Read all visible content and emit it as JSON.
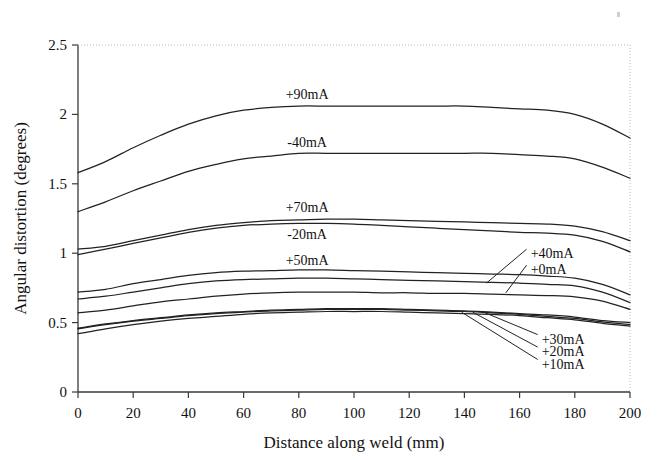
{
  "chart_data": {
    "type": "line",
    "title": "",
    "xlabel": "Distance along weld (mm)",
    "ylabel": "Angular distortion (degrees)",
    "xlim": [
      0,
      200
    ],
    "ylim": [
      0,
      2.5
    ],
    "xticks": [
      0,
      20,
      40,
      60,
      80,
      100,
      120,
      140,
      160,
      180,
      200
    ],
    "yticks": [
      0,
      0.5,
      1,
      1.5,
      2,
      2.5
    ],
    "xtick_labels": [
      "0",
      "20",
      "40",
      "60",
      "80",
      "100",
      "120",
      "140",
      "160",
      "180",
      "200"
    ],
    "ytick_labels": [
      "0",
      "0.5",
      "1",
      "1.5",
      "2",
      "2.5"
    ],
    "grid": false,
    "legend_position": "inline-annotations",
    "x": [
      0,
      10,
      20,
      30,
      40,
      50,
      60,
      70,
      80,
      90,
      100,
      110,
      120,
      130,
      140,
      150,
      160,
      170,
      180,
      190,
      200
    ],
    "series": [
      {
        "name": "+90mA",
        "label": "+90mA",
        "label_x": 83,
        "label_y": 2.15,
        "label_mode": "inline",
        "values": [
          1.58,
          1.66,
          1.76,
          1.85,
          1.93,
          1.99,
          2.03,
          2.05,
          2.06,
          2.06,
          2.06,
          2.06,
          2.06,
          2.06,
          2.06,
          2.05,
          2.04,
          2.03,
          2.0,
          1.93,
          1.83
        ]
      },
      {
        "name": "-40mA",
        "label": "-40mA",
        "label_x": 83,
        "label_y": 1.8,
        "label_mode": "inline",
        "values": [
          1.3,
          1.37,
          1.45,
          1.52,
          1.59,
          1.64,
          1.68,
          1.7,
          1.72,
          1.72,
          1.72,
          1.72,
          1.72,
          1.72,
          1.72,
          1.72,
          1.71,
          1.7,
          1.68,
          1.62,
          1.54
        ]
      },
      {
        "name": "+70mA",
        "label": "+70mA",
        "label_x": 83,
        "label_y": 1.33,
        "label_mode": "inline",
        "values": [
          1.03,
          1.05,
          1.09,
          1.13,
          1.17,
          1.2,
          1.22,
          1.235,
          1.24,
          1.245,
          1.245,
          1.24,
          1.235,
          1.23,
          1.225,
          1.22,
          1.215,
          1.21,
          1.195,
          1.155,
          1.09
        ]
      },
      {
        "name": "-20mA",
        "label": "-20mA",
        "label_x": 83,
        "label_y": 1.135,
        "label_mode": "inline",
        "values": [
          0.99,
          1.03,
          1.07,
          1.11,
          1.15,
          1.18,
          1.2,
          1.21,
          1.215,
          1.215,
          1.21,
          1.2,
          1.19,
          1.18,
          1.17,
          1.16,
          1.15,
          1.145,
          1.13,
          1.085,
          1.01
        ]
      },
      {
        "name": "+50mA",
        "label": "+50mA",
        "label_x": 83,
        "label_y": 0.95,
        "label_mode": "inline",
        "values": [
          0.72,
          0.74,
          0.78,
          0.81,
          0.84,
          0.86,
          0.87,
          0.875,
          0.88,
          0.88,
          0.875,
          0.87,
          0.865,
          0.86,
          0.855,
          0.85,
          0.845,
          0.835,
          0.82,
          0.775,
          0.7
        ]
      },
      {
        "name": "+40mA",
        "label": "+40mA",
        "label_x": 164,
        "label_y": 1.0,
        "label_mode": "leader",
        "leader_to_x": 148,
        "leader_to_y": 0.785,
        "values": [
          0.67,
          0.69,
          0.72,
          0.75,
          0.78,
          0.8,
          0.81,
          0.815,
          0.82,
          0.82,
          0.815,
          0.81,
          0.805,
          0.8,
          0.795,
          0.79,
          0.785,
          0.775,
          0.765,
          0.72,
          0.645
        ]
      },
      {
        "name": "+0mA",
        "label": "+0mA",
        "label_x": 164,
        "label_y": 0.885,
        "label_mode": "leader",
        "leader_to_x": 155,
        "leader_to_y": 0.715,
        "values": [
          0.57,
          0.59,
          0.62,
          0.65,
          0.67,
          0.69,
          0.705,
          0.715,
          0.72,
          0.72,
          0.72,
          0.715,
          0.715,
          0.71,
          0.71,
          0.705,
          0.7,
          0.695,
          0.685,
          0.655,
          0.595
        ]
      },
      {
        "name": "+30mA",
        "label": "+30mA",
        "label_x": 168,
        "label_y": 0.385,
        "label_mode": "leader",
        "leader_to_x": 147,
        "leader_to_y": 0.575,
        "values": [
          0.46,
          0.49,
          0.515,
          0.535,
          0.555,
          0.57,
          0.58,
          0.59,
          0.595,
          0.6,
          0.6,
          0.6,
          0.595,
          0.59,
          0.585,
          0.575,
          0.565,
          0.555,
          0.54,
          0.515,
          0.5
        ]
      },
      {
        "name": "+20mA",
        "label": "+20mA",
        "label_x": 168,
        "label_y": 0.295,
        "label_mode": "leader",
        "leader_to_x": 143,
        "leader_to_y": 0.575,
        "values": [
          0.455,
          0.485,
          0.51,
          0.53,
          0.55,
          0.565,
          0.575,
          0.585,
          0.59,
          0.595,
          0.595,
          0.595,
          0.59,
          0.585,
          0.58,
          0.57,
          0.56,
          0.545,
          0.53,
          0.505,
          0.485
        ]
      },
      {
        "name": "+10mA",
        "label": "+10mA",
        "label_x": 168,
        "label_y": 0.205,
        "label_mode": "leader",
        "leader_to_x": 139,
        "leader_to_y": 0.575,
        "values": [
          0.42,
          0.455,
          0.485,
          0.51,
          0.53,
          0.545,
          0.56,
          0.57,
          0.575,
          0.58,
          0.58,
          0.58,
          0.575,
          0.57,
          0.565,
          0.56,
          0.55,
          0.535,
          0.52,
          0.495,
          0.475
        ]
      }
    ]
  }
}
